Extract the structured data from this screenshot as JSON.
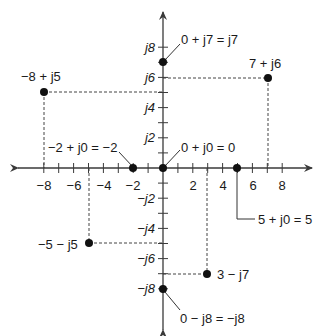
{
  "diagram": {
    "title": "",
    "type": "complex-plane",
    "colors": {
      "axis": "#3a3a3a",
      "point": "#111111",
      "dashed": "#444444",
      "text": "#1a1a1a"
    },
    "x_axis": {
      "range": [
        -8,
        8
      ],
      "tick_step": 1,
      "labels": [
        {
          "value": -8,
          "text": "−8"
        },
        {
          "value": -6,
          "text": "−6"
        },
        {
          "value": -4,
          "text": "−4"
        },
        {
          "value": -2,
          "text": "−2"
        },
        {
          "value": 2,
          "text": "2"
        },
        {
          "value": 4,
          "text": "4"
        },
        {
          "value": 6,
          "text": "6"
        },
        {
          "value": 8,
          "text": "8"
        }
      ]
    },
    "y_axis": {
      "range": [
        -8,
        8
      ],
      "tick_step": 1,
      "labels": [
        {
          "value": 8,
          "text": "j8"
        },
        {
          "value": 6,
          "text": "j6"
        },
        {
          "value": 4,
          "text": "j4"
        },
        {
          "value": 2,
          "text": "j2"
        },
        {
          "value": -2,
          "text": "−j2"
        },
        {
          "value": -4,
          "text": "−j4"
        },
        {
          "value": -6,
          "text": "−j6"
        },
        {
          "value": -8,
          "text": "−j8"
        }
      ]
    },
    "points": [
      {
        "re": 0,
        "im": 7,
        "label": "0 + j7 = j7",
        "dashed": false
      },
      {
        "re": 7,
        "im": 6,
        "label": "7 + j6",
        "dashed": true
      },
      {
        "re": -8,
        "im": 5,
        "label": "−8 + j5",
        "dashed": true
      },
      {
        "re": -2,
        "im": 0,
        "label": "−2 + j0 = −2",
        "dashed": false
      },
      {
        "re": 0,
        "im": 0,
        "label": "0 + j0 = 0",
        "dashed": false
      },
      {
        "re": 5,
        "im": 0,
        "label": "5 + j0 = 5",
        "dashed": false
      },
      {
        "re": -5,
        "im": -5,
        "label": "−5 − j5",
        "dashed": true
      },
      {
        "re": 3,
        "im": -7,
        "label": "3 − j7",
        "dashed": true
      },
      {
        "re": 0,
        "im": -8,
        "label": "0 − j8 = −j8",
        "dashed": false
      }
    ]
  }
}
